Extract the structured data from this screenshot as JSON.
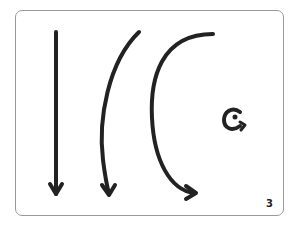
{
  "diagram": {
    "page_number": "3",
    "colors": {
      "stroke": "#222222",
      "border": "#9a9a9a",
      "background": "#ffffff"
    },
    "elements": [
      {
        "name": "straight-down-arrow-icon"
      },
      {
        "name": "slight-curve-arrow-icon"
      },
      {
        "name": "strong-curve-arrow-icon"
      },
      {
        "name": "rotation-icon"
      }
    ]
  }
}
